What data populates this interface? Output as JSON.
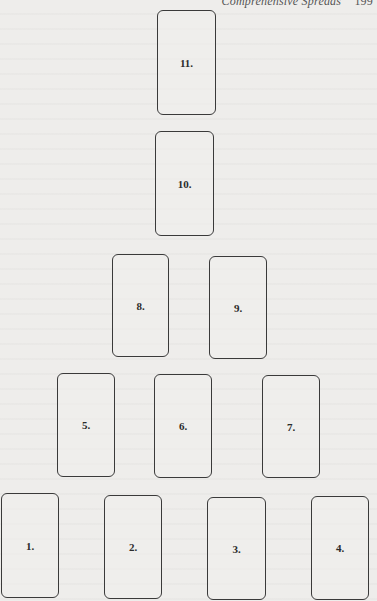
{
  "page": {
    "running_head": "Comprehensive Spreads",
    "page_number": "199"
  },
  "diagram": {
    "type": "tarot-card-spread",
    "card_count": 11,
    "layout": "pyramid",
    "rows": [
      {
        "row": 1,
        "position": "bottom",
        "cards": [
          "1.",
          "2.",
          "3.",
          "4."
        ]
      },
      {
        "row": 2,
        "cards": [
          "5.",
          "6.",
          "7."
        ]
      },
      {
        "row": 3,
        "cards": [
          "8.",
          "9."
        ]
      },
      {
        "row": 4,
        "cards": [
          "10."
        ]
      },
      {
        "row": 5,
        "position": "top",
        "cards": [
          "11."
        ]
      }
    ],
    "cards": [
      {
        "id": 1,
        "label": "1.",
        "x": 1,
        "y": 493,
        "w": 58,
        "h": 105
      },
      {
        "id": 2,
        "label": "2.",
        "x": 104,
        "y": 495,
        "w": 58,
        "h": 104
      },
      {
        "id": 3,
        "label": "3.",
        "x": 207,
        "y": 497,
        "w": 59,
        "h": 103
      },
      {
        "id": 4,
        "label": "4.",
        "x": 311,
        "y": 496,
        "w": 58,
        "h": 104
      },
      {
        "id": 5,
        "label": "5.",
        "x": 57,
        "y": 373,
        "w": 58,
        "h": 104
      },
      {
        "id": 6,
        "label": "6.",
        "x": 154,
        "y": 374,
        "w": 58,
        "h": 104
      },
      {
        "id": 7,
        "label": "7.",
        "x": 262,
        "y": 375,
        "w": 58,
        "h": 103
      },
      {
        "id": 8,
        "label": "8.",
        "x": 112,
        "y": 254,
        "w": 57,
        "h": 103
      },
      {
        "id": 9,
        "label": "9.",
        "x": 209,
        "y": 256,
        "w": 58,
        "h": 103
      },
      {
        "id": 10,
        "label": "10.",
        "x": 155,
        "y": 131,
        "w": 59,
        "h": 105
      },
      {
        "id": 11,
        "label": "11.",
        "x": 157,
        "y": 10,
        "w": 59,
        "h": 105
      }
    ]
  },
  "colors": {
    "paper": "#eeedeb",
    "card_border": "#3a3a3a",
    "text": "#2b2b2b"
  }
}
